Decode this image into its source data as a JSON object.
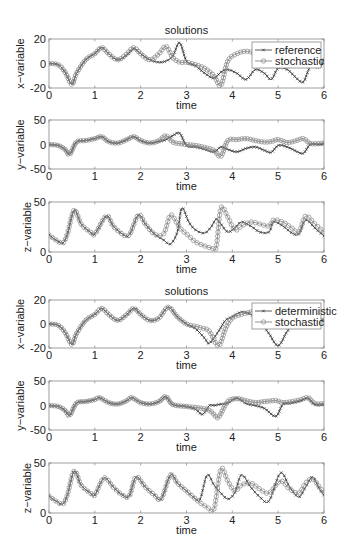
{
  "figure": {
    "groups": [
      {
        "title": "solutions",
        "legend": [
          "reference",
          "stochastic"
        ]
      },
      {
        "title": "solutions",
        "legend": [
          "deterministic",
          "stochastic"
        ]
      }
    ],
    "xlabel": "time"
  },
  "chart_data": [
    {
      "type": "line",
      "title": "solutions",
      "xlabel": "time",
      "ylabel": "x-variable",
      "xlim": [
        0,
        6
      ],
      "ylim": [
        -20,
        20
      ],
      "xticks": [
        0,
        1,
        2,
        3,
        4,
        5,
        6
      ],
      "yticks": [
        -20,
        0,
        20
      ],
      "legend_position": "upper right",
      "x": [
        0,
        0.2,
        0.35,
        0.5,
        0.6,
        0.8,
        1.0,
        1.15,
        1.3,
        1.5,
        1.7,
        1.85,
        2.0,
        2.2,
        2.4,
        2.55,
        2.7,
        2.85,
        3.0,
        3.2,
        3.4,
        3.6,
        3.75,
        3.9,
        4.1,
        4.3,
        4.5,
        4.7,
        4.85,
        5.0,
        5.2,
        5.4,
        5.55,
        5.7,
        5.9,
        6.0
      ],
      "series": [
        {
          "name": "reference",
          "marker": "x",
          "values": [
            0,
            -1,
            -7,
            -17,
            -8,
            3,
            8,
            13,
            8,
            3,
            7,
            12,
            8,
            3,
            1,
            2,
            6,
            17,
            2,
            -2,
            -8,
            -12,
            -7,
            -5,
            -8,
            -13,
            -5,
            -8,
            -13,
            -4,
            -5,
            -12,
            -15,
            -3,
            -3,
            3
          ]
        },
        {
          "name": "stochastic",
          "marker": "o",
          "values": [
            0,
            -1,
            -7,
            -17,
            -8,
            3,
            8,
            13,
            8,
            3,
            8,
            13,
            8,
            3,
            8,
            14,
            5,
            1,
            1,
            -1,
            -4,
            -10,
            -18,
            2,
            8,
            10,
            8,
            4,
            2,
            3,
            4,
            3,
            2,
            1,
            0,
            2
          ]
        }
      ]
    },
    {
      "type": "line",
      "xlabel": "time",
      "ylabel": "y-variable",
      "xlim": [
        0,
        6
      ],
      "ylim": [
        -50,
        50
      ],
      "xticks": [
        0,
        1,
        2,
        3,
        4,
        5,
        6
      ],
      "yticks": [
        -50,
        0,
        50
      ],
      "x": [
        0,
        0.2,
        0.35,
        0.45,
        0.6,
        0.8,
        1.0,
        1.15,
        1.3,
        1.5,
        1.7,
        1.85,
        2.0,
        2.2,
        2.4,
        2.55,
        2.7,
        2.85,
        3.0,
        3.2,
        3.4,
        3.6,
        3.75,
        3.9,
        4.1,
        4.3,
        4.5,
        4.7,
        4.85,
        5.0,
        5.2,
        5.4,
        5.55,
        5.7,
        5.9,
        6.0
      ],
      "series": [
        {
          "name": "reference",
          "values": [
            0,
            -2,
            -10,
            -20,
            5,
            8,
            12,
            16,
            6,
            3,
            10,
            16,
            8,
            3,
            6,
            10,
            18,
            23,
            -2,
            -5,
            -10,
            -15,
            -5,
            -10,
            -15,
            -8,
            -5,
            -12,
            -16,
            -2,
            -5,
            -14,
            -18,
            0,
            0,
            2
          ]
        },
        {
          "name": "stochastic",
          "values": [
            0,
            -2,
            -10,
            -20,
            5,
            8,
            12,
            16,
            6,
            3,
            10,
            16,
            8,
            3,
            8,
            18,
            5,
            2,
            0,
            -2,
            -6,
            -12,
            -24,
            8,
            10,
            12,
            8,
            5,
            6,
            10,
            4,
            8,
            12,
            2,
            2,
            3
          ]
        }
      ]
    },
    {
      "type": "line",
      "xlabel": "time",
      "ylabel": "z-variable",
      "xlim": [
        0,
        6
      ],
      "ylim": [
        0,
        50
      ],
      "xticks": [
        0,
        1,
        2,
        3,
        4,
        5,
        6
      ],
      "yticks": [
        0,
        50
      ],
      "x": [
        0,
        0.15,
        0.3,
        0.4,
        0.55,
        0.7,
        0.9,
        1.0,
        1.25,
        1.4,
        1.6,
        1.75,
        1.95,
        2.1,
        2.3,
        2.5,
        2.65,
        2.8,
        2.9,
        3.05,
        3.2,
        3.4,
        3.55,
        3.65,
        3.75,
        3.9,
        4.05,
        4.2,
        4.4,
        4.6,
        4.8,
        4.9,
        5.1,
        5.3,
        5.45,
        5.6,
        5.8,
        6.0
      ],
      "series": [
        {
          "name": "reference",
          "values": [
            17,
            12,
            9,
            18,
            42,
            28,
            20,
            18,
            36,
            26,
            18,
            17,
            37,
            28,
            18,
            12,
            8,
            20,
            44,
            30,
            22,
            19,
            26,
            33,
            28,
            20,
            24,
            30,
            26,
            20,
            20,
            30,
            26,
            19,
            18,
            32,
            24,
            16
          ]
        },
        {
          "name": "stochastic",
          "values": [
            17,
            12,
            9,
            18,
            42,
            28,
            20,
            18,
            36,
            26,
            18,
            17,
            37,
            28,
            18,
            18,
            37,
            28,
            22,
            16,
            10,
            6,
            4,
            5,
            44,
            35,
            22,
            26,
            30,
            28,
            26,
            32,
            30,
            24,
            20,
            36,
            28,
            20
          ]
        }
      ]
    },
    {
      "type": "line",
      "title": "solutions",
      "xlabel": "time",
      "ylabel": "x-variable",
      "xlim": [
        0,
        6
      ],
      "ylim": [
        -20,
        20
      ],
      "xticks": [
        0,
        1,
        2,
        3,
        4,
        5,
        6
      ],
      "yticks": [
        -20,
        0,
        20
      ],
      "legend_position": "upper right",
      "x": [
        0,
        0.2,
        0.35,
        0.5,
        0.6,
        0.8,
        1.0,
        1.15,
        1.3,
        1.5,
        1.7,
        1.85,
        2.0,
        2.2,
        2.4,
        2.6,
        2.8,
        3.0,
        3.2,
        3.4,
        3.5,
        3.7,
        3.85,
        4.0,
        4.2,
        4.4,
        4.6,
        4.8,
        5.0,
        5.2,
        5.4,
        5.6,
        5.8,
        6.0
      ],
      "series": [
        {
          "name": "deterministic",
          "marker": "x",
          "values": [
            0,
            -1,
            -7,
            -17,
            -8,
            3,
            8,
            13,
            8,
            3,
            8,
            13,
            8,
            3,
            5,
            14,
            6,
            0,
            -4,
            -12,
            -16,
            -6,
            3,
            6,
            10,
            8,
            2,
            -8,
            -18,
            -6,
            2,
            6,
            4,
            3
          ]
        },
        {
          "name": "stochastic",
          "marker": "o",
          "values": [
            0,
            -1,
            -7,
            -17,
            -8,
            3,
            8,
            13,
            8,
            3,
            8,
            13,
            8,
            3,
            5,
            14,
            6,
            0,
            -2,
            -4,
            -6,
            -18,
            -4,
            5,
            8,
            10,
            12,
            8,
            6,
            4,
            4,
            5,
            4,
            3
          ]
        }
      ]
    },
    {
      "type": "line",
      "xlabel": "time",
      "ylabel": "y-variable",
      "xlim": [
        0,
        6
      ],
      "ylim": [
        -50,
        50
      ],
      "xticks": [
        0,
        1,
        2,
        3,
        4,
        5,
        6
      ],
      "yticks": [
        -50,
        0,
        50
      ],
      "x": [
        0,
        0.2,
        0.35,
        0.45,
        0.6,
        0.8,
        1.0,
        1.1,
        1.3,
        1.5,
        1.7,
        1.8,
        2.0,
        2.2,
        2.4,
        2.55,
        2.7,
        3.0,
        3.2,
        3.35,
        3.5,
        3.6,
        3.7,
        3.9,
        4.1,
        4.3,
        4.5,
        4.7,
        4.95,
        5.1,
        5.3,
        5.5,
        5.65,
        5.8,
        6.0
      ],
      "series": [
        {
          "name": "deterministic",
          "values": [
            0,
            -2,
            -10,
            -20,
            5,
            8,
            12,
            16,
            6,
            3,
            10,
            16,
            6,
            3,
            8,
            18,
            2,
            -2,
            -8,
            -18,
            0,
            0,
            2,
            5,
            15,
            4,
            0,
            -6,
            -22,
            2,
            5,
            10,
            15,
            2,
            2
          ]
        },
        {
          "name": "stochastic",
          "values": [
            0,
            -2,
            -10,
            -20,
            5,
            8,
            12,
            16,
            6,
            3,
            10,
            16,
            6,
            3,
            8,
            18,
            2,
            -2,
            -4,
            -6,
            -10,
            -18,
            -24,
            8,
            14,
            10,
            6,
            8,
            10,
            6,
            8,
            12,
            16,
            4,
            4
          ]
        }
      ]
    },
    {
      "type": "line",
      "xlabel": "time",
      "ylabel": "z-variable",
      "xlim": [
        0,
        6
      ],
      "ylim": [
        0,
        50
      ],
      "xticks": [
        0,
        1,
        2,
        3,
        4,
        5,
        6
      ],
      "yticks": [
        0,
        50
      ],
      "x": [
        0,
        0.15,
        0.3,
        0.4,
        0.55,
        0.7,
        0.9,
        1.0,
        1.2,
        1.4,
        1.6,
        1.75,
        1.9,
        2.1,
        2.3,
        2.45,
        2.65,
        2.8,
        3.0,
        3.2,
        3.3,
        3.45,
        3.6,
        3.75,
        3.9,
        4.05,
        4.2,
        4.4,
        4.6,
        4.8,
        5.05,
        5.25,
        5.45,
        5.6,
        5.75,
        5.9,
        6.0
      ],
      "series": [
        {
          "name": "deterministic",
          "values": [
            17,
            12,
            9,
            18,
            42,
            28,
            20,
            18,
            35,
            26,
            18,
            17,
            36,
            26,
            18,
            14,
            38,
            30,
            22,
            14,
            14,
            38,
            28,
            20,
            14,
            20,
            38,
            26,
            16,
            12,
            40,
            26,
            16,
            26,
            36,
            24,
            18
          ]
        },
        {
          "name": "stochastic",
          "values": [
            17,
            12,
            9,
            18,
            42,
            28,
            20,
            18,
            35,
            26,
            18,
            17,
            36,
            26,
            18,
            14,
            38,
            30,
            22,
            14,
            10,
            6,
            4,
            44,
            32,
            22,
            28,
            30,
            24,
            20,
            32,
            24,
            20,
            30,
            34,
            26,
            20
          ]
        }
      ]
    }
  ]
}
